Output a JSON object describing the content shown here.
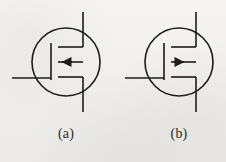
{
  "figure": {
    "background_color": "#f2f1ef",
    "line_color": "#1c1c1c",
    "stroke_width": 1.6,
    "symbols": [
      {
        "id": "symbol-a",
        "caption": "(a)",
        "device": "n-channel enhancement MOSFET",
        "arrow_direction": "left",
        "arrow_label": "substrate-arrow-inward",
        "circle": {
          "cx": 66,
          "cy": 62,
          "r": 34
        },
        "gate_bar": {
          "x": 51,
          "y1": 43,
          "y2": 81
        },
        "gate_lead": {
          "x1": 12,
          "y": 78,
          "x2": 51
        },
        "channel_segments_y": [
          47,
          62,
          77
        ],
        "channel_x1": 58,
        "channel_x2": 83,
        "drain_source_x": 83,
        "drain_lead": {
          "x": 83,
          "y1": 12,
          "y2": 47
        },
        "source_lead": {
          "x": 83,
          "y1": 77,
          "y2": 112
        }
      },
      {
        "id": "symbol-b",
        "caption": "(b)",
        "device": "p-channel enhancement MOSFET",
        "arrow_direction": "right",
        "arrow_label": "substrate-arrow-outward",
        "circle": {
          "cx": 179,
          "cy": 62,
          "r": 34
        },
        "gate_bar": {
          "x": 164,
          "y1": 43,
          "y2": 81
        },
        "gate_lead": {
          "x1": 125,
          "y": 78,
          "x2": 164
        },
        "channel_segments_y": [
          47,
          62,
          77
        ],
        "channel_x1": 171,
        "channel_x2": 196,
        "drain_source_x": 196,
        "drain_lead": {
          "x": 196,
          "y1": 12,
          "y2": 47
        },
        "source_lead": {
          "x": 196,
          "y1": 77,
          "y2": 112
        }
      }
    ]
  },
  "captions": {
    "a": "(a)",
    "b": "(b)"
  }
}
